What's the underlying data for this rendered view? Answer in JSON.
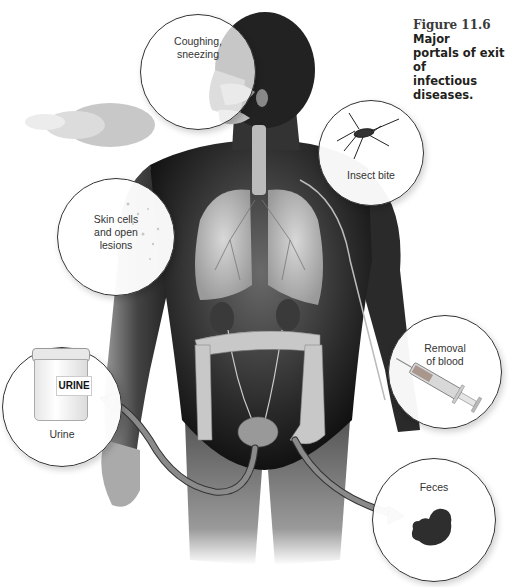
{
  "figure": {
    "number": "Figure 11.6",
    "title": "Major portals of exit of infectious diseases.",
    "title_line1": "Major",
    "title_line2": "portals of exit of",
    "title_line3": "infectious diseases."
  },
  "callouts": [
    {
      "id": "coughing",
      "line1": "Coughing,",
      "line2": "sneezing",
      "icon": "spray-droplets-icon"
    },
    {
      "id": "insect",
      "line1": "Insect bite",
      "icon": "mosquito-icon"
    },
    {
      "id": "skin",
      "line1": "Skin cells",
      "line2": "and open",
      "line3": "lesions",
      "icon": "skin-flakes-icon"
    },
    {
      "id": "blood",
      "line1": "Removal",
      "line2": "of blood",
      "icon": "syringe-icon"
    },
    {
      "id": "urine",
      "line1": "Urine",
      "icon": "urine-cup-icon",
      "cup_label": "URINE"
    },
    {
      "id": "feces",
      "line1": "Feces",
      "icon": "feces-icon"
    }
  ],
  "colors": {
    "arrow_fill": "#8a8a8a",
    "arrow_stroke": "#333333",
    "body_dark": "#1e1e1e",
    "organ": "#bdbdbd",
    "callout_border": "#333333"
  }
}
